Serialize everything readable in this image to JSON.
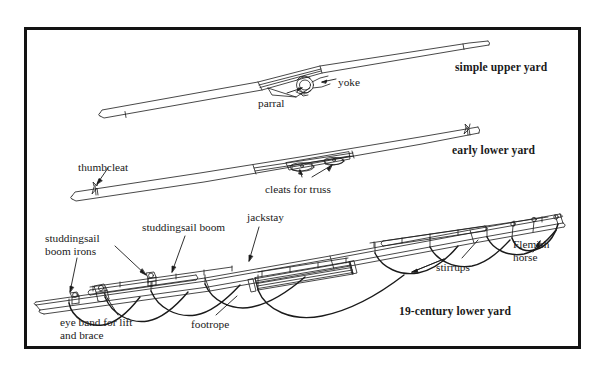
{
  "figure": {
    "kind": "technical-line-diagram",
    "border_color": "#131313",
    "background": "#ffffff",
    "ink_color": "#1a1a1a"
  },
  "titles": [
    {
      "id": "simple-upper-yard",
      "text": "simple upper yard",
      "x": 455,
      "y": 62
    },
    {
      "id": "early-lower-yard",
      "text": "early lower yard",
      "x": 452,
      "y": 145
    },
    {
      "id": "19-century-lower-yard",
      "text": "19-century lower yard",
      "x": 399,
      "y": 306
    }
  ],
  "callouts": [
    {
      "id": "yoke",
      "text": "yoke",
      "x": 338,
      "y": 76
    },
    {
      "id": "parral",
      "text": "parral",
      "x": 258,
      "y": 97
    },
    {
      "id": "thumbcleat",
      "text": "thumbcleat",
      "x": 78,
      "y": 161
    },
    {
      "id": "cleats-for-truss",
      "text": "cleats for truss",
      "x": 265,
      "y": 183
    },
    {
      "id": "studdingsail-boom-irons",
      "line1": "studdingsail",
      "line2": "boom irons",
      "x": 45,
      "y": 232
    },
    {
      "id": "studdingsail-boom",
      "text": "studdingsail boom",
      "x": 142,
      "y": 221
    },
    {
      "id": "jackstay",
      "text": "jackstay",
      "x": 247,
      "y": 211
    },
    {
      "id": "stirrups",
      "text": "stirrups",
      "x": 436,
      "y": 261
    },
    {
      "id": "flemish-horse",
      "line1": "Flemish",
      "line2": "horse",
      "x": 513,
      "y": 238
    },
    {
      "id": "footrope",
      "text": "footrope",
      "x": 191,
      "y": 318
    },
    {
      "id": "eye-band-for-lift-and-brace",
      "line1": "eye band for lift",
      "line2": "and brace",
      "x": 60,
      "y": 316
    }
  ]
}
